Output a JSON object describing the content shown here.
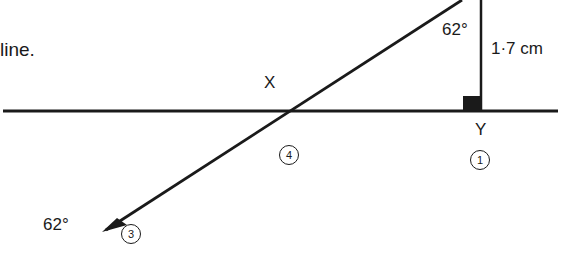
{
  "text_fragment": "line.",
  "labels": {
    "point_x": "X",
    "point_y": "Y",
    "angle_top": "62°",
    "angle_bottom": "62°",
    "length": "1·7 cm"
  },
  "step_markers": [
    "1",
    "3",
    "4"
  ],
  "colors": {
    "ink": "#1a1a1a",
    "background": "#ffffff"
  }
}
